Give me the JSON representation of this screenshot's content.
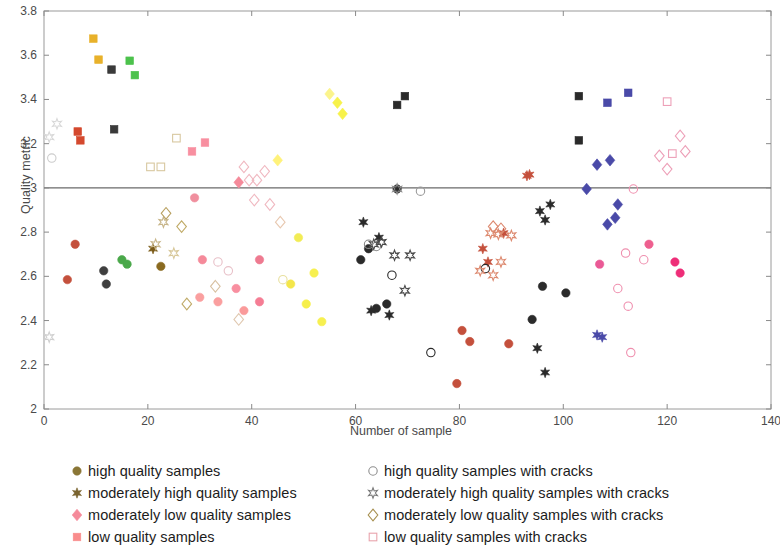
{
  "chart_data": {
    "type": "scatter",
    "title": "",
    "xlabel": "Number of sample",
    "ylabel": "Quality metric",
    "xlim": [
      0,
      140
    ],
    "ylim": [
      2,
      3.8
    ],
    "xticks": [
      0,
      20,
      40,
      60,
      80,
      100,
      120,
      140
    ],
    "yticks": [
      "2",
      "2.2",
      "2.4",
      "2.6",
      "2.8",
      "3",
      "3.2",
      "3.4",
      "3.6",
      "3.8"
    ],
    "grid": false,
    "reference_lines": [
      {
        "axis": "y",
        "value": 3
      }
    ],
    "legend_position": "below",
    "colors": {
      "high": "#8a7636",
      "moderately_high": "#7a6430",
      "moderately_low": "#f58a9a",
      "low": "#f98c8c",
      "high_cracks": "#8e8e8e",
      "moderately_high_cracks": "#7a7a7a",
      "moderately_low_cracks": "#a79050",
      "low_cracks": "#e9a4ad"
    },
    "series": [
      {
        "name": "high quality samples",
        "marker": "circle",
        "fill": "filled",
        "legend_color": "#8a7636",
        "points": [
          {
            "x": 4.5,
            "y": 2.585,
            "color": "#c4503c"
          },
          {
            "x": 6.0,
            "y": 2.745,
            "color": "#c4503c"
          },
          {
            "x": 11.5,
            "y": 2.625,
            "color": "#3f3f3f"
          },
          {
            "x": 12.0,
            "y": 2.565,
            "color": "#3f3f3f"
          },
          {
            "x": 15.0,
            "y": 2.675,
            "color": "#4aa84a"
          },
          {
            "x": 16.0,
            "y": 2.655,
            "color": "#4aa84a"
          },
          {
            "x": 22.5,
            "y": 2.645,
            "color": "#8a6a20"
          },
          {
            "x": 29.0,
            "y": 2.955,
            "color": "#f08f9e"
          },
          {
            "x": 30.5,
            "y": 2.675,
            "color": "#f58a9a"
          },
          {
            "x": 30.0,
            "y": 2.505,
            "color": "#fa9f9f"
          },
          {
            "x": 33.5,
            "y": 2.485,
            "color": "#fa9f9f"
          },
          {
            "x": 37.0,
            "y": 2.545,
            "color": "#f88fa0"
          },
          {
            "x": 38.5,
            "y": 2.445,
            "color": "#fa9a9a"
          },
          {
            "x": 41.5,
            "y": 2.675,
            "color": "#ee7a90"
          },
          {
            "x": 41.5,
            "y": 2.485,
            "color": "#f57d94"
          },
          {
            "x": 47.5,
            "y": 2.565,
            "color": "#f4e64a"
          },
          {
            "x": 49.0,
            "y": 2.775,
            "color": "#f2ec55"
          },
          {
            "x": 50.5,
            "y": 2.475,
            "color": "#f6ef4a"
          },
          {
            "x": 52.0,
            "y": 2.615,
            "color": "#f7f050"
          },
          {
            "x": 53.5,
            "y": 2.395,
            "color": "#f7f050"
          },
          {
            "x": 61.0,
            "y": 2.675,
            "color": "#2a2a2a"
          },
          {
            "x": 62.5,
            "y": 2.725,
            "color": "#2a2a2a"
          },
          {
            "x": 64.0,
            "y": 2.455,
            "color": "#2a2a2a"
          },
          {
            "x": 66.0,
            "y": 2.475,
            "color": "#2a2a2a"
          },
          {
            "x": 68.0,
            "y": 2.995,
            "color": "#2a2a2a"
          },
          {
            "x": 79.5,
            "y": 2.115,
            "color": "#c4503c"
          },
          {
            "x": 80.5,
            "y": 2.355,
            "color": "#c4503c"
          },
          {
            "x": 82.0,
            "y": 2.305,
            "color": "#c4503c"
          },
          {
            "x": 89.5,
            "y": 2.295,
            "color": "#c4503c"
          },
          {
            "x": 94.0,
            "y": 2.405,
            "color": "#2b2b2b"
          },
          {
            "x": 96.0,
            "y": 2.555,
            "color": "#2b2b2b"
          },
          {
            "x": 100.5,
            "y": 2.525,
            "color": "#2b2b2b"
          },
          {
            "x": 107.0,
            "y": 2.655,
            "color": "#ea5a96"
          },
          {
            "x": 116.5,
            "y": 2.745,
            "color": "#ee5f8f"
          },
          {
            "x": 121.5,
            "y": 2.665,
            "color": "#ee2e78"
          },
          {
            "x": 122.5,
            "y": 2.615,
            "color": "#ee2e78"
          }
        ]
      },
      {
        "name": "moderately high quality samples",
        "marker": "star6",
        "fill": "filled",
        "legend_color": "#7a6430",
        "points": [
          {
            "x": 21.0,
            "y": 2.725,
            "color": "#7a5a18"
          },
          {
            "x": 61.5,
            "y": 2.845,
            "color": "#2a2a2a"
          },
          {
            "x": 64.5,
            "y": 2.775,
            "color": "#2a2a2a"
          },
          {
            "x": 66.5,
            "y": 2.425,
            "color": "#2a2a2a"
          },
          {
            "x": 63.0,
            "y": 2.445,
            "color": "#2a2a2a"
          },
          {
            "x": 84.5,
            "y": 2.725,
            "color": "#c4503c"
          },
          {
            "x": 85.5,
            "y": 2.665,
            "color": "#c4503c"
          },
          {
            "x": 88.5,
            "y": 2.795,
            "color": "#c4503c"
          },
          {
            "x": 93.0,
            "y": 3.055,
            "color": "#c4503c"
          },
          {
            "x": 93.5,
            "y": 3.06,
            "color": "#c4503c"
          },
          {
            "x": 95.5,
            "y": 2.895,
            "color": "#2a2a2a"
          },
          {
            "x": 97.5,
            "y": 2.925,
            "color": "#2a2a2a"
          },
          {
            "x": 96.5,
            "y": 2.855,
            "color": "#2a2a2a"
          },
          {
            "x": 95.0,
            "y": 2.275,
            "color": "#2a2a2a"
          },
          {
            "x": 96.5,
            "y": 2.165,
            "color": "#2a2a2a"
          },
          {
            "x": 106.5,
            "y": 2.335,
            "color": "#4a4aa8"
          },
          {
            "x": 107.5,
            "y": 2.325,
            "color": "#4a4aa8"
          }
        ]
      },
      {
        "name": "moderately low quality samples",
        "marker": "diamond",
        "fill": "filled",
        "legend_color": "#f58a9a",
        "points": [
          {
            "x": 37.5,
            "y": 3.025,
            "color": "#f58a9a"
          },
          {
            "x": 45.0,
            "y": 3.125,
            "color": "#fff27a"
          },
          {
            "x": 55.0,
            "y": 3.425,
            "color": "#fbf48c"
          },
          {
            "x": 56.5,
            "y": 3.385,
            "color": "#f7f24a"
          },
          {
            "x": 57.5,
            "y": 3.335,
            "color": "#f7f24a"
          },
          {
            "x": 104.5,
            "y": 2.995,
            "color": "#4a4aa8"
          },
          {
            "x": 106.5,
            "y": 3.105,
            "color": "#4a4aa8"
          },
          {
            "x": 109.0,
            "y": 3.125,
            "color": "#4a4aa8"
          },
          {
            "x": 110.0,
            "y": 2.865,
            "color": "#4a4aa8"
          },
          {
            "x": 108.5,
            "y": 2.835,
            "color": "#4a4aa8"
          },
          {
            "x": 110.5,
            "y": 2.925,
            "color": "#4a4aa8"
          }
        ]
      },
      {
        "name": "low quality samples",
        "marker": "square",
        "fill": "filled",
        "legend_color": "#f98c8c",
        "points": [
          {
            "x": 9.5,
            "y": 3.675,
            "color": "#e8b12a"
          },
          {
            "x": 10.5,
            "y": 3.58,
            "color": "#e8b12a"
          },
          {
            "x": 6.5,
            "y": 3.255,
            "color": "#d4492e"
          },
          {
            "x": 7.0,
            "y": 3.215,
            "color": "#d4492e"
          },
          {
            "x": 13.0,
            "y": 3.535,
            "color": "#3a3a3a"
          },
          {
            "x": 16.5,
            "y": 3.575,
            "color": "#4cc24c"
          },
          {
            "x": 17.5,
            "y": 3.51,
            "color": "#4cc24c"
          },
          {
            "x": 13.5,
            "y": 3.265,
            "color": "#3a3a3a"
          },
          {
            "x": 28.5,
            "y": 3.165,
            "color": "#f88fa0"
          },
          {
            "x": 31.0,
            "y": 3.205,
            "color": "#f88fa0"
          },
          {
            "x": 68.0,
            "y": 3.375,
            "color": "#2a2a2a"
          },
          {
            "x": 69.5,
            "y": 3.415,
            "color": "#2a2a2a"
          },
          {
            "x": 103.0,
            "y": 3.415,
            "color": "#2a2a2a"
          },
          {
            "x": 103.0,
            "y": 3.215,
            "color": "#2a2a2a"
          },
          {
            "x": 108.5,
            "y": 3.385,
            "color": "#4a4aa8"
          },
          {
            "x": 112.5,
            "y": 3.43,
            "color": "#4a4aa8"
          }
        ]
      },
      {
        "name": "high quality samples with cracks",
        "marker": "circle",
        "fill": "open",
        "legend_color": "#8e8e8e",
        "points": [
          {
            "x": 1.5,
            "y": 3.135,
            "color": "#cccccc"
          },
          {
            "x": 33.5,
            "y": 2.665,
            "color": "#e8c0c8"
          },
          {
            "x": 35.5,
            "y": 2.625,
            "color": "#e8c0c8"
          },
          {
            "x": 46.0,
            "y": 2.585,
            "color": "#e8e0a0"
          },
          {
            "x": 62.5,
            "y": 2.745,
            "color": "#888888"
          },
          {
            "x": 64.0,
            "y": 2.735,
            "color": "#888888"
          },
          {
            "x": 67.0,
            "y": 2.605,
            "color": "#2a2a2a"
          },
          {
            "x": 72.5,
            "y": 2.985,
            "color": "#9a9a9a"
          },
          {
            "x": 74.5,
            "y": 2.255,
            "color": "#2a2a2a"
          },
          {
            "x": 85.0,
            "y": 2.635,
            "color": "#2a2a2a"
          },
          {
            "x": 113.5,
            "y": 2.995,
            "color": "#ef8fae"
          },
          {
            "x": 112.0,
            "y": 2.705,
            "color": "#ef8fae"
          },
          {
            "x": 110.5,
            "y": 2.545,
            "color": "#ef8fae"
          },
          {
            "x": 115.5,
            "y": 2.675,
            "color": "#ef8fae"
          },
          {
            "x": 112.5,
            "y": 2.465,
            "color": "#ef8fae"
          },
          {
            "x": 113.0,
            "y": 2.255,
            "color": "#ef8fae"
          }
        ]
      },
      {
        "name": "moderately high quality samples with cracks",
        "marker": "star6",
        "fill": "open",
        "legend_color": "#7a7a7a",
        "points": [
          {
            "x": 1.0,
            "y": 3.23,
            "color": "#d8d8d8"
          },
          {
            "x": 2.5,
            "y": 3.29,
            "color": "#d8d8d8"
          },
          {
            "x": 1.0,
            "y": 2.325,
            "color": "#d0d0d0"
          },
          {
            "x": 23.0,
            "y": 2.845,
            "color": "#c8b68a"
          },
          {
            "x": 21.5,
            "y": 2.745,
            "color": "#c8b68a"
          },
          {
            "x": 25.0,
            "y": 2.705,
            "color": "#d8c89a"
          },
          {
            "x": 68.0,
            "y": 2.995,
            "color": "#8a8a8a"
          },
          {
            "x": 63.5,
            "y": 2.745,
            "color": "#4a4a4a"
          },
          {
            "x": 65.0,
            "y": 2.755,
            "color": "#4a4a4a"
          },
          {
            "x": 67.5,
            "y": 2.695,
            "color": "#4a4a4a"
          },
          {
            "x": 70.5,
            "y": 2.695,
            "color": "#4a4a4a"
          },
          {
            "x": 69.5,
            "y": 2.535,
            "color": "#4a4a4a"
          },
          {
            "x": 86.0,
            "y": 2.795,
            "color": "#dd8a70"
          },
          {
            "x": 87.5,
            "y": 2.79,
            "color": "#dd8a70"
          },
          {
            "x": 90.0,
            "y": 2.785,
            "color": "#dd8a70"
          },
          {
            "x": 88.0,
            "y": 2.665,
            "color": "#dd8a70"
          },
          {
            "x": 86.5,
            "y": 2.605,
            "color": "#dd8a70"
          },
          {
            "x": 84.0,
            "y": 2.625,
            "color": "#dd8a70"
          }
        ]
      },
      {
        "name": "moderately low quality samples with cracks",
        "marker": "diamond",
        "fill": "open",
        "legend_color": "#a79050",
        "points": [
          {
            "x": 23.5,
            "y": 2.885,
            "color": "#b8a060"
          },
          {
            "x": 26.5,
            "y": 2.825,
            "color": "#c0ab68"
          },
          {
            "x": 27.5,
            "y": 2.475,
            "color": "#c0ab68"
          },
          {
            "x": 33.0,
            "y": 2.555,
            "color": "#d8c0a0"
          },
          {
            "x": 37.5,
            "y": 2.405,
            "color": "#e0c8b0"
          },
          {
            "x": 38.5,
            "y": 3.095,
            "color": "#f0b8c0"
          },
          {
            "x": 39.5,
            "y": 3.035,
            "color": "#f0b8c0"
          },
          {
            "x": 41.0,
            "y": 3.035,
            "color": "#f0b8c0"
          },
          {
            "x": 40.5,
            "y": 2.945,
            "color": "#f0b8c0"
          },
          {
            "x": 42.5,
            "y": 3.075,
            "color": "#f0b8c0"
          },
          {
            "x": 43.5,
            "y": 2.925,
            "color": "#f0b8c0"
          },
          {
            "x": 45.5,
            "y": 2.845,
            "color": "#e8c8b0"
          },
          {
            "x": 86.5,
            "y": 2.825,
            "color": "#dd8a70"
          },
          {
            "x": 88.0,
            "y": 2.815,
            "color": "#dd8a70"
          },
          {
            "x": 118.5,
            "y": 3.145,
            "color": "#eda0b8"
          },
          {
            "x": 120.0,
            "y": 3.085,
            "color": "#eda0b8"
          },
          {
            "x": 122.5,
            "y": 3.235,
            "color": "#eda0b8"
          },
          {
            "x": 123.5,
            "y": 3.165,
            "color": "#eda0b8"
          }
        ]
      },
      {
        "name": "low quality samples with cracks",
        "marker": "square",
        "fill": "open",
        "legend_color": "#e9a4ad",
        "points": [
          {
            "x": 25.5,
            "y": 3.225,
            "color": "#d8c8a0"
          },
          {
            "x": 20.5,
            "y": 3.095,
            "color": "#d8c8a0"
          },
          {
            "x": 22.5,
            "y": 3.095,
            "color": "#d8c8a0"
          },
          {
            "x": 120.0,
            "y": 3.39,
            "color": "#eda0b8"
          },
          {
            "x": 121.0,
            "y": 3.155,
            "color": "#eda0b8"
          }
        ]
      }
    ]
  },
  "legend": {
    "left_items": [
      {
        "label": "high quality samples",
        "marker": "circle",
        "fill": "filled",
        "color": "#8a7636"
      },
      {
        "label": "moderately high quality samples",
        "marker": "star6",
        "fill": "filled",
        "color": "#7a6430"
      },
      {
        "label": "moderately low quality samples",
        "marker": "diamond",
        "fill": "filled",
        "color": "#f58a9a"
      },
      {
        "label": "low quality samples",
        "marker": "square",
        "fill": "filled",
        "color": "#f98c8c"
      }
    ],
    "right_items": [
      {
        "label": "high quality samples with cracks",
        "marker": "circle",
        "fill": "open",
        "color": "#8e8e8e"
      },
      {
        "label": "moderately high quality samples with cracks",
        "marker": "star6",
        "fill": "open",
        "color": "#7a7a7a"
      },
      {
        "label": "moderately low quality samples with cracks",
        "marker": "diamond",
        "fill": "open",
        "color": "#a79050"
      },
      {
        "label": "low quality samples with cracks",
        "marker": "square",
        "fill": "open",
        "color": "#e9a4ad"
      }
    ]
  }
}
